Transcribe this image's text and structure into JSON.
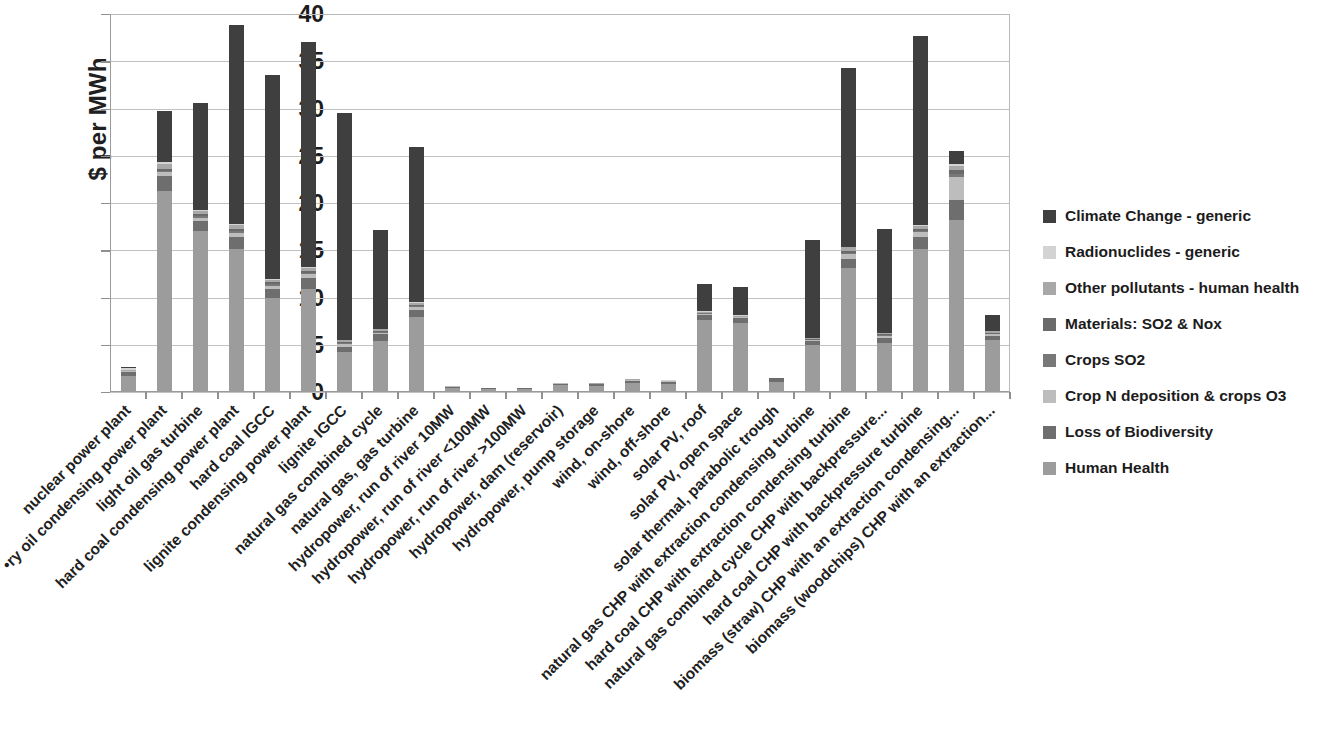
{
  "chart_data": {
    "type": "bar",
    "stacked": true,
    "title": "",
    "subtitle": "",
    "xlabel": "",
    "ylabel": "$ per MWh",
    "ylim": [
      0,
      40
    ],
    "yticks": [
      0,
      5,
      10,
      15,
      20,
      25,
      30,
      35,
      40
    ],
    "grid": true,
    "legend_position": "right",
    "categories": [
      "nuclear power plant",
      "•ry oil condensing power plant",
      "light oil gas turbine",
      "hard coal condensing power plant",
      "hard coal IGCC",
      "lignite condensing power plant",
      "lignite IGCC",
      "natural gas combined cycle",
      "natural gas, gas turbine",
      "hydropower, run of river 10MW",
      "hydropower, run of river <100MW",
      "hydropower, run of river >100MW",
      "hydropower, dam (reservoir)",
      "hydropower, pump storage",
      "wind, on-shore",
      "wind, off-shore",
      "solar PV, roof",
      "solar PV, open space",
      "solar thermal, parabolic trough",
      "natural gas CHP with extraction condensing turbine",
      "hard coal CHP with extraction condensing turbine",
      "natural gas combined cycle CHP with backpressure...",
      "hard coal CHP with backpressure turbine",
      "biomass (straw) CHP with an extraction condensing...",
      "biomass (woodchips) CHP with an extraction..."
    ],
    "series": [
      {
        "name": "Human Health",
        "color": "#9c9c9c",
        "values": [
          1.65,
          21.3,
          17.0,
          15.1,
          10.0,
          10.9,
          4.2,
          5.4,
          7.9,
          0.45,
          0.3,
          0.3,
          0.7,
          0.65,
          0.95,
          0.85,
          7.6,
          7.3,
          1.1,
          5.0,
          13.1,
          5.2,
          15.1,
          18.2,
          5.5
        ]
      },
      {
        "name": "Loss of Biodiversity",
        "color": "#6e6e6e",
        "values": [
          0.5,
          1.6,
          1.1,
          1.3,
          0.9,
          1.2,
          0.6,
          0.7,
          0.8,
          0.12,
          0.08,
          0.08,
          0.18,
          0.17,
          0.25,
          0.22,
          0.55,
          0.5,
          0.25,
          0.35,
          1.0,
          0.55,
          1.3,
          2.1,
          0.4
        ]
      },
      {
        "name": "Crop N deposition & crops O3",
        "color": "#bdbdbd",
        "values": [
          0.05,
          0.35,
          0.35,
          0.45,
          0.35,
          0.35,
          0.25,
          0.2,
          0.3,
          0.03,
          0.02,
          0.02,
          0.04,
          0.04,
          0.06,
          0.05,
          0.12,
          0.1,
          0.06,
          0.15,
          0.5,
          0.2,
          0.5,
          2.5,
          0.2
        ]
      },
      {
        "name": "Crops SO2",
        "color": "#787878",
        "values": [
          0.02,
          0.15,
          0.15,
          0.2,
          0.15,
          0.15,
          0.1,
          0.08,
          0.1,
          0.01,
          0.01,
          0.01,
          0.02,
          0.02,
          0.03,
          0.02,
          0.05,
          0.04,
          0.02,
          0.05,
          0.15,
          0.07,
          0.15,
          0.3,
          0.08
        ]
      },
      {
        "name": "Materials: SO2 & Nox",
        "color": "#6a6a6a",
        "values": [
          0.03,
          0.2,
          0.2,
          0.25,
          0.2,
          0.2,
          0.12,
          0.1,
          0.12,
          0.01,
          0.01,
          0.01,
          0.02,
          0.02,
          0.03,
          0.02,
          0.06,
          0.05,
          0.02,
          0.06,
          0.2,
          0.08,
          0.2,
          0.35,
          0.1
        ]
      },
      {
        "name": "Other pollutants - human health",
        "color": "#a8a8a8",
        "values": [
          0.05,
          0.5,
          0.35,
          0.35,
          0.3,
          0.3,
          0.2,
          0.15,
          0.2,
          0.02,
          0.01,
          0.01,
          0.03,
          0.03,
          0.05,
          0.04,
          0.1,
          0.08,
          0.04,
          0.1,
          0.35,
          0.15,
          0.35,
          0.5,
          0.15
        ]
      },
      {
        "name": "Radionuclides - generic",
        "color": "#d3d3d3",
        "values": [
          0.25,
          0.2,
          0.1,
          0.1,
          0.1,
          0.1,
          0.08,
          0.07,
          0.08,
          0.01,
          0.01,
          0.01,
          0.01,
          0.02,
          0.03,
          0.02,
          0.05,
          0.04,
          0.02,
          0.04,
          0.1,
          0.05,
          0.1,
          0.15,
          0.05
        ]
      },
      {
        "name": "Climate Change - generic",
        "color": "#3f3f3f",
        "values": [
          0.15,
          5.4,
          11.3,
          21.1,
          21.6,
          23.8,
          24.0,
          10.5,
          16.4,
          0.0,
          0.0,
          0.0,
          0.0,
          0.0,
          0.0,
          0.0,
          2.9,
          3.0,
          0.0,
          10.3,
          18.9,
          11.0,
          20.0,
          1.4,
          1.7
        ]
      }
    ],
    "totals": [
      2.7,
      29.7,
      30.55,
      38.85,
      33.6,
      36.9,
      29.55,
      17.2,
      25.9,
      0.65,
      0.44,
      0.44,
      1.0,
      0.95,
      1.4,
      1.22,
      11.43,
      11.11,
      1.51,
      16.05,
      34.3,
      17.3,
      37.7,
      25.5,
      8.18
    ]
  },
  "legend": {
    "items": [
      {
        "label": "Climate Change - generic",
        "color": "#3f3f3f"
      },
      {
        "label": "Radionuclides - generic",
        "color": "#d3d3d3"
      },
      {
        "label": "Other pollutants - human health",
        "color": "#a8a8a8"
      },
      {
        "label": "Materials: SO2 & Nox",
        "color": "#6a6a6a"
      },
      {
        "label": "Crops SO2",
        "color": "#787878"
      },
      {
        "label": "Crop N deposition & crops O3",
        "color": "#bdbdbd"
      },
      {
        "label": "Loss of Biodiversity",
        "color": "#6e6e6e"
      },
      {
        "label": "Human Health",
        "color": "#9c9c9c"
      }
    ]
  },
  "axis": {
    "y_title": "$ per MWh",
    "y_ticks": [
      "0",
      "5",
      "10",
      "15",
      "20",
      "25",
      "30",
      "35",
      "40"
    ]
  }
}
